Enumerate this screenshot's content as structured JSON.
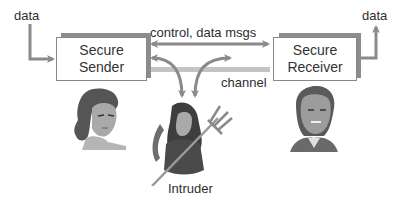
{
  "diagram": {
    "input_label": "data",
    "output_label": "data",
    "sender": {
      "line1": "Secure",
      "line2": "Sender"
    },
    "receiver": {
      "line1": "Secure",
      "line2": "Receiver"
    },
    "messages_label": "control, data msgs",
    "channel_label": "channel",
    "intruder_label": "Intruder",
    "figures": {
      "sender_figure": "woman-portrait",
      "receiver_figure": "man-portrait",
      "intruder_figure": "devil-with-trident"
    },
    "colors": {
      "arrow": "#8a8a8a",
      "channel": "#c4c4c4",
      "box_border": "#888888",
      "box_shadow": "#8c8c8c",
      "text": "#2e2e2e"
    }
  }
}
